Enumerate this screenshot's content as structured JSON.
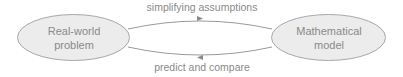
{
  "nodes": [
    {
      "id": "real-world",
      "line1": "Real-world",
      "line2": "problem"
    },
    {
      "id": "math-model",
      "line1": "Mathematical",
      "line2": "model"
    }
  ],
  "edges": [
    {
      "from": "real-world",
      "to": "math-model",
      "label": "simplifying assumptions"
    },
    {
      "from": "math-model",
      "to": "real-world",
      "label": "predict and compare"
    }
  ],
  "colors": {
    "node_fill": "#ececec",
    "node_stroke": "#a8a8a8",
    "edge_stroke": "#9a9a9a",
    "text": "#8a8a8a"
  }
}
